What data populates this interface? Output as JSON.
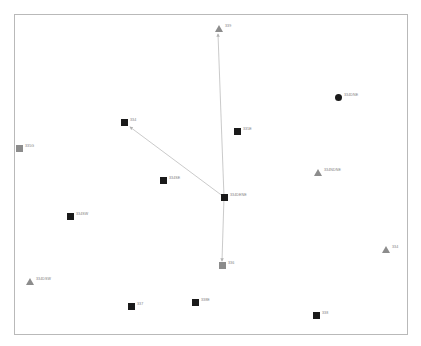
{
  "figure": {
    "type": "scatter-network-diagram",
    "background_color": "#ffffff",
    "frame_color": "#b9b9b9",
    "label_color": "#7b7b7b",
    "edge_color": "#b3b3b3"
  },
  "chart_data": {
    "type": "scatter",
    "title": "",
    "xlabel": "",
    "ylabel": "",
    "grid": false,
    "legend": "none",
    "xlim": [
      0,
      394
    ],
    "ylim": [
      0,
      321
    ],
    "colors": {
      "black_marker": "#1a1a1a",
      "gray_marker": "#8c8c8c",
      "edge": "#b3b3b3",
      "frame": "#b9b9b9",
      "label": "#7b7b7b"
    },
    "points": [
      {
        "id": "p1",
        "label": "339",
        "x": 218,
        "y": 28,
        "marker": "triangle",
        "color": "#8c8c8c",
        "role": "arrow-terminal"
      },
      {
        "id": "p2",
        "label": "334DNE",
        "x": 338,
        "y": 97,
        "marker": "circle",
        "color": "#1a1a1a",
        "role": "node"
      },
      {
        "id": "p3",
        "label": "334",
        "x": 124,
        "y": 122,
        "marker": "square",
        "color": "#1a1a1a",
        "role": "node"
      },
      {
        "id": "p4",
        "label": "335E",
        "x": 237,
        "y": 131,
        "marker": "square",
        "color": "#1a1a1a",
        "role": "node"
      },
      {
        "id": "p5",
        "label": "335G",
        "x": 19,
        "y": 148,
        "marker": "square",
        "color": "#8c8c8c",
        "role": "node"
      },
      {
        "id": "p6",
        "label": "334NDNE",
        "x": 317,
        "y": 172,
        "marker": "triangle",
        "color": "#8c8c8c",
        "role": "node"
      },
      {
        "id": "p7",
        "label": "334SE",
        "x": 163,
        "y": 180,
        "marker": "square",
        "color": "#1a1a1a",
        "role": "node"
      },
      {
        "id": "p8",
        "label": "334DENE",
        "x": 224,
        "y": 197,
        "marker": "square",
        "color": "#1a1a1a",
        "role": "hub"
      },
      {
        "id": "p9",
        "label": "334SW",
        "x": 70,
        "y": 216,
        "marker": "square",
        "color": "#1a1a1a",
        "role": "node"
      },
      {
        "id": "p10",
        "label": "334",
        "x": 385,
        "y": 249,
        "marker": "triangle",
        "color": "#8c8c8c",
        "role": "node"
      },
      {
        "id": "p11",
        "label": "336",
        "x": 222,
        "y": 265,
        "marker": "square",
        "color": "#8c8c8c",
        "role": "arrow-terminal"
      },
      {
        "id": "p12",
        "label": "334DSW",
        "x": 29,
        "y": 281,
        "marker": "triangle",
        "color": "#8c8c8c",
        "role": "node"
      },
      {
        "id": "p13",
        "label": "337",
        "x": 131,
        "y": 306,
        "marker": "square",
        "color": "#1a1a1a",
        "role": "node"
      },
      {
        "id": "p14",
        "label": "338E",
        "x": 195,
        "y": 302,
        "marker": "square",
        "color": "#1a1a1a",
        "role": "node"
      },
      {
        "id": "p15",
        "label": "338",
        "x": 316,
        "y": 315,
        "marker": "square",
        "color": "#1a1a1a",
        "role": "node"
      }
    ],
    "edges": [
      {
        "id": "e1",
        "from": "334DENE",
        "to": "339",
        "arrow": "to",
        "x1": 224,
        "y1": 197,
        "x2": 218,
        "y2": 34
      },
      {
        "id": "e2",
        "from": "334DENE",
        "to": "334",
        "arrow": "to",
        "x1": 224,
        "y1": 197,
        "x2": 130,
        "y2": 127
      },
      {
        "id": "e3",
        "from": "334DENE",
        "to": "336",
        "arrow": "to",
        "x1": 224,
        "y1": 197,
        "x2": 222,
        "y2": 261
      }
    ]
  }
}
